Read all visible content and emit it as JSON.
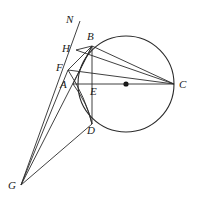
{
  "figure": {
    "kind": "euclidean-geometry-diagram",
    "canvas": {
      "width": 197,
      "height": 209
    },
    "stroke_color": "#2b2b2b",
    "background_color": "#ffffff",
    "label_color": "#1a1a1a"
  },
  "circle": {
    "name": "main-circle",
    "center_label": "",
    "cx": 126,
    "cy": 84,
    "r": 48,
    "center_dot_r": 2.6
  },
  "points": [
    {
      "id": "N",
      "label": "N",
      "x": 80,
      "y": 21,
      "label_x": 66,
      "label_y": 14,
      "marker": false
    },
    {
      "id": "B",
      "label": "B",
      "x": 92,
      "y": 46,
      "label_x": 87,
      "label_y": 31,
      "marker": false
    },
    {
      "id": "H",
      "label": "H",
      "x": 76,
      "y": 50,
      "label_x": 62,
      "label_y": 43,
      "marker": false
    },
    {
      "id": "F",
      "label": "F",
      "x": 68,
      "y": 70,
      "label_x": 56,
      "label_y": 62,
      "marker": false
    },
    {
      "id": "A",
      "label": "A",
      "x": 73,
      "y": 84,
      "label_x": 60,
      "label_y": 79,
      "marker": false
    },
    {
      "id": "E",
      "label": "E",
      "x": 92,
      "y": 84,
      "label_x": 90,
      "label_y": 86,
      "marker": false
    },
    {
      "id": "C",
      "label": "C",
      "x": 174,
      "y": 84,
      "label_x": 179,
      "label_y": 79,
      "marker": false
    },
    {
      "id": "D",
      "label": "D",
      "x": 92,
      "y": 124,
      "label_x": 87,
      "label_y": 125,
      "marker": false
    },
    {
      "id": "G",
      "label": "G",
      "x": 21,
      "y": 185,
      "label_x": 8,
      "label_y": 180,
      "marker": false
    }
  ],
  "segments": [
    {
      "id": "seg-N-G",
      "from": "N",
      "to": "G",
      "note": "transversal through H, F, A region"
    },
    {
      "id": "seg-H-B",
      "from": "H",
      "to": "B"
    },
    {
      "id": "seg-H-C",
      "from": "H",
      "to": "C"
    },
    {
      "id": "seg-F-B",
      "from": "F",
      "to": "B"
    },
    {
      "id": "seg-F-C",
      "from": "F",
      "to": "C"
    },
    {
      "id": "seg-A-C",
      "from": "A",
      "to": "C",
      "note": "diameter through E and center"
    },
    {
      "id": "seg-B-C",
      "from": "B",
      "to": "C"
    },
    {
      "id": "seg-B-D",
      "from": "B",
      "to": "D",
      "note": "vertical chord through E"
    },
    {
      "id": "seg-B-G",
      "from": "B",
      "to": "G"
    },
    {
      "id": "seg-F-G",
      "from": "F",
      "to": "G"
    },
    {
      "id": "seg-D-G",
      "from": "D",
      "to": "G"
    },
    {
      "id": "seg-A-B",
      "from": "A",
      "to": "B"
    },
    {
      "id": "seg-A-D",
      "from": "A",
      "to": "D",
      "note": "arc-like short chord"
    }
  ]
}
